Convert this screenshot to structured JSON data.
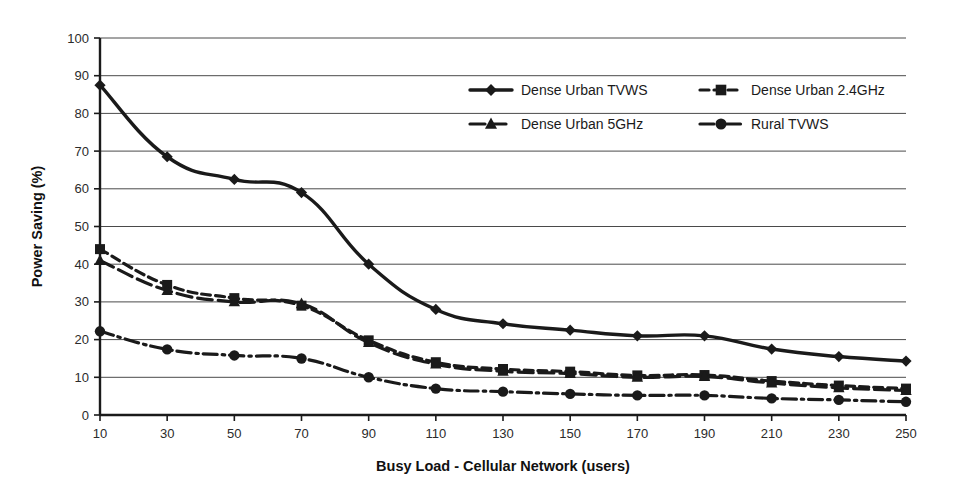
{
  "chart_data": {
    "type": "line",
    "title": "",
    "xlabel": "Busy Load - Cellular Network (users)",
    "ylabel": "Power Saving (%)",
    "x": [
      10,
      30,
      50,
      70,
      90,
      110,
      130,
      150,
      170,
      190,
      210,
      230,
      250
    ],
    "xticklabels": [
      "10",
      "30",
      "50",
      "70",
      "90",
      "110",
      "130",
      "150",
      "170",
      "190",
      "210",
      "230",
      "250"
    ],
    "xlim": [
      10,
      250
    ],
    "ylim": [
      0,
      100
    ],
    "yticks": [
      0,
      10,
      20,
      30,
      40,
      50,
      60,
      70,
      80,
      90,
      100
    ],
    "yticklabels": [
      "0",
      "10",
      "20",
      "30",
      "40",
      "50",
      "60",
      "70",
      "80",
      "90",
      "100"
    ],
    "grid": "horizontal",
    "legend_position": "upper-center-inside",
    "series": [
      {
        "name": "Dense Urban TVWS",
        "marker": "diamond",
        "linestyle": "solid",
        "color": "#1a1a1a",
        "values": [
          87.5,
          68.5,
          62.5,
          59.0,
          40.0,
          28.0,
          24.2,
          22.5,
          21.0,
          21.0,
          17.5,
          15.5,
          14.3
        ]
      },
      {
        "name": "Dense Urban 2.4GHz",
        "marker": "square",
        "linestyle": "dashed",
        "color": "#1a1a1a",
        "values": [
          44.0,
          34.5,
          31.0,
          29.0,
          19.8,
          14.0,
          12.2,
          11.5,
          10.5,
          10.6,
          9.0,
          7.8,
          7.0
        ]
      },
      {
        "name": "Dense Urban 5GHz",
        "marker": "triangle",
        "linestyle": "long-dash",
        "color": "#1a1a1a",
        "values": [
          41.0,
          33.0,
          30.0,
          29.5,
          19.2,
          13.5,
          11.6,
          11.0,
          10.0,
          10.2,
          8.5,
          7.2,
          6.5
        ]
      },
      {
        "name": "Rural TVWS",
        "marker": "circle",
        "linestyle": "dash-dot",
        "color": "#1a1a1a",
        "values": [
          22.2,
          17.4,
          15.8,
          15.0,
          10.0,
          7.0,
          6.2,
          5.6,
          5.2,
          5.2,
          4.4,
          4.0,
          3.5
        ]
      }
    ]
  },
  "legend": {
    "entries": [
      {
        "label": "Dense Urban TVWS"
      },
      {
        "label": "Dense Urban 2.4GHz"
      },
      {
        "label": "Dense Urban 5GHz"
      },
      {
        "label": "Rural TVWS"
      }
    ]
  }
}
